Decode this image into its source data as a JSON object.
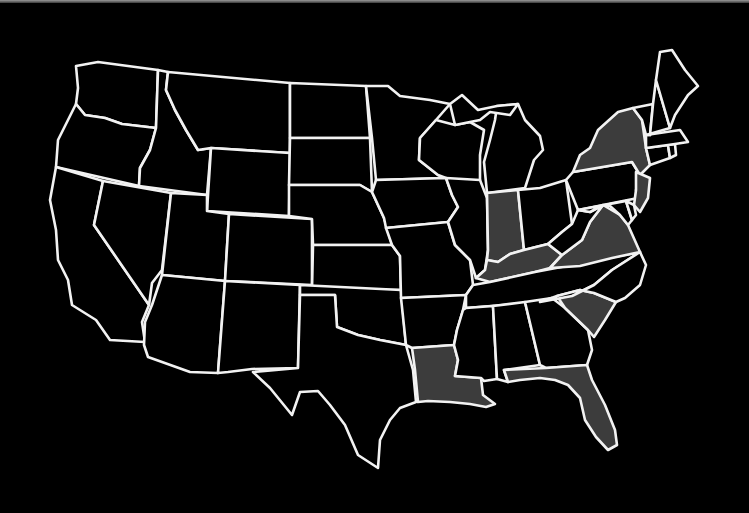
{
  "map": {
    "title": "",
    "background": "#000000",
    "border_color": "#f2f2f2",
    "default_fill": "#000000",
    "highlight_fill": "#3c3c3c",
    "highlighted_states": [
      "NY",
      "NJ",
      "IN",
      "KY",
      "VA",
      "SC",
      "LA",
      "FL"
    ],
    "states": [
      {
        "code": "WA",
        "highlighted": false
      },
      {
        "code": "OR",
        "highlighted": false
      },
      {
        "code": "CA",
        "highlighted": false
      },
      {
        "code": "ID",
        "highlighted": false
      },
      {
        "code": "NV",
        "highlighted": false
      },
      {
        "code": "MT",
        "highlighted": false
      },
      {
        "code": "WY",
        "highlighted": false
      },
      {
        "code": "UT",
        "highlighted": false
      },
      {
        "code": "AZ",
        "highlighted": false
      },
      {
        "code": "CO",
        "highlighted": false
      },
      {
        "code": "NM",
        "highlighted": false
      },
      {
        "code": "ND",
        "highlighted": false
      },
      {
        "code": "SD",
        "highlighted": false
      },
      {
        "code": "NE",
        "highlighted": false
      },
      {
        "code": "KS",
        "highlighted": false
      },
      {
        "code": "OK",
        "highlighted": false
      },
      {
        "code": "TX",
        "highlighted": false
      },
      {
        "code": "MN",
        "highlighted": false
      },
      {
        "code": "IA",
        "highlighted": false
      },
      {
        "code": "MO",
        "highlighted": false
      },
      {
        "code": "AR",
        "highlighted": false
      },
      {
        "code": "LA",
        "highlighted": true
      },
      {
        "code": "WI",
        "highlighted": false
      },
      {
        "code": "IL",
        "highlighted": false
      },
      {
        "code": "MI",
        "highlighted": false
      },
      {
        "code": "IN",
        "highlighted": true
      },
      {
        "code": "OH",
        "highlighted": false
      },
      {
        "code": "KY",
        "highlighted": true
      },
      {
        "code": "TN",
        "highlighted": false
      },
      {
        "code": "MS",
        "highlighted": false
      },
      {
        "code": "AL",
        "highlighted": false
      },
      {
        "code": "GA",
        "highlighted": false
      },
      {
        "code": "FL",
        "highlighted": true
      },
      {
        "code": "SC",
        "highlighted": true
      },
      {
        "code": "NC",
        "highlighted": false
      },
      {
        "code": "VA",
        "highlighted": true
      },
      {
        "code": "WV",
        "highlighted": false
      },
      {
        "code": "PA",
        "highlighted": false
      },
      {
        "code": "NY",
        "highlighted": true
      },
      {
        "code": "NJ",
        "highlighted": true
      },
      {
        "code": "DE",
        "highlighted": false
      },
      {
        "code": "MD",
        "highlighted": false
      },
      {
        "code": "CT",
        "highlighted": false
      },
      {
        "code": "RI",
        "highlighted": false
      },
      {
        "code": "MA",
        "highlighted": false
      },
      {
        "code": "VT",
        "highlighted": false
      },
      {
        "code": "NH",
        "highlighted": false
      },
      {
        "code": "ME",
        "highlighted": false
      }
    ]
  }
}
